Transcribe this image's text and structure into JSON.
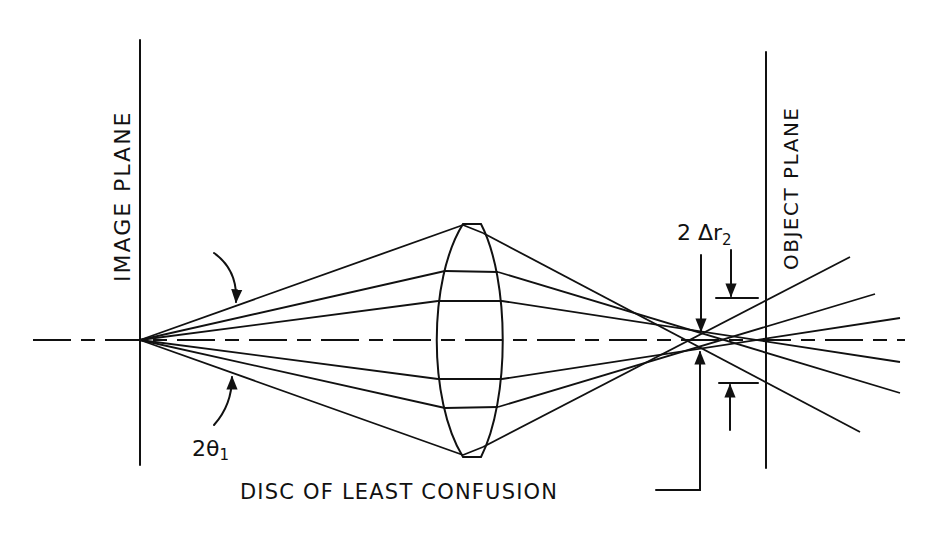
{
  "diagram": {
    "labels": {
      "image_plane": "IMAGE PLANE",
      "object_plane": "OBJECT PLANE",
      "angle": "2θ",
      "angle_sub": "1",
      "delta_prefix": "2 Δr",
      "delta_sub": "2",
      "disc": "DISC OF LEAST CONFUSION"
    },
    "colors": {
      "ink": "#111111",
      "background": "#ffffff"
    },
    "geometry": {
      "optical_axis_y": 340,
      "image_plane_x": 140,
      "object_plane_x": 766,
      "lens_center_x": 465,
      "disc_x": 697
    }
  }
}
